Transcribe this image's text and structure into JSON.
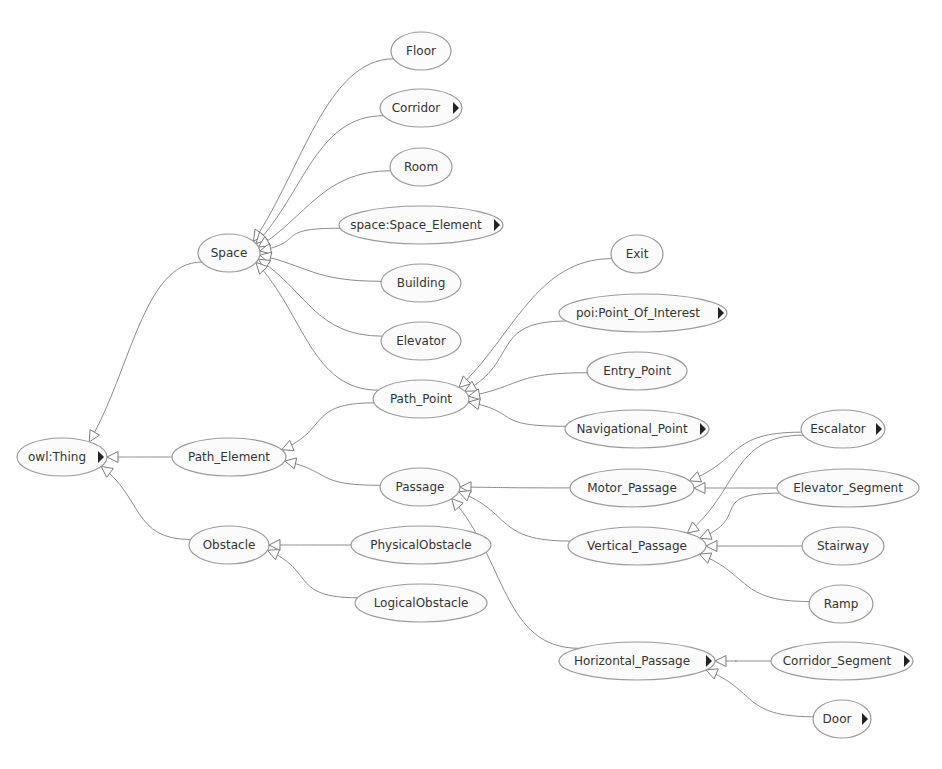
{
  "diagram": {
    "type": "ontology-class-hierarchy",
    "colors": {
      "node_fill": "#fbfbfb",
      "node_stroke": "#9a9a9a",
      "edge": "#8a8a8a",
      "text": "#333333",
      "expand_marker": "#222222"
    },
    "nodes": [
      {
        "id": "owl_thing",
        "label": "owl:Thing",
        "x": 62,
        "y": 457,
        "rx": 45,
        "ry": 19,
        "expandable": true
      },
      {
        "id": "space",
        "label": "Space",
        "x": 229,
        "y": 253,
        "rx": 31,
        "ry": 19,
        "expandable": false
      },
      {
        "id": "path_element",
        "label": "Path_Element",
        "x": 229,
        "y": 457,
        "rx": 57,
        "ry": 19,
        "expandable": false
      },
      {
        "id": "obstacle",
        "label": "Obstacle",
        "x": 229,
        "y": 545,
        "rx": 40,
        "ry": 19,
        "expandable": false
      },
      {
        "id": "floor",
        "label": "Floor",
        "x": 421,
        "y": 51,
        "rx": 30,
        "ry": 19,
        "expandable": false
      },
      {
        "id": "corridor",
        "label": "Corridor",
        "x": 421,
        "y": 108,
        "rx": 41,
        "ry": 19,
        "expandable": true
      },
      {
        "id": "room",
        "label": "Room",
        "x": 421,
        "y": 167,
        "rx": 31,
        "ry": 19,
        "expandable": false
      },
      {
        "id": "space_element",
        "label": "space:Space_Element",
        "x": 421,
        "y": 225,
        "rx": 82,
        "ry": 19,
        "expandable": true
      },
      {
        "id": "building",
        "label": "Building",
        "x": 421,
        "y": 283,
        "rx": 40,
        "ry": 19,
        "expandable": false
      },
      {
        "id": "elevator",
        "label": "Elevator",
        "x": 421,
        "y": 341,
        "rx": 40,
        "ry": 19,
        "expandable": false
      },
      {
        "id": "path_point",
        "label": "Path_Point",
        "x": 421,
        "y": 399,
        "rx": 48,
        "ry": 19,
        "expandable": false
      },
      {
        "id": "passage",
        "label": "Passage",
        "x": 420,
        "y": 487,
        "rx": 40,
        "ry": 19,
        "expandable": false
      },
      {
        "id": "physical_obstacle",
        "label": "PhysicalObstacle",
        "x": 421,
        "y": 545,
        "rx": 70,
        "ry": 19,
        "expandable": false
      },
      {
        "id": "logical_obstacle",
        "label": "LogicalObstacle",
        "x": 421,
        "y": 603,
        "rx": 66,
        "ry": 19,
        "expandable": false
      },
      {
        "id": "exit",
        "label": "Exit",
        "x": 637,
        "y": 254,
        "rx": 26,
        "ry": 19,
        "expandable": false
      },
      {
        "id": "poi",
        "label": "poi:Point_Of_Interest",
        "x": 643,
        "y": 313,
        "rx": 84,
        "ry": 19,
        "expandable": true
      },
      {
        "id": "entry_point",
        "label": "Entry_Point",
        "x": 637,
        "y": 371,
        "rx": 50,
        "ry": 19,
        "expandable": false
      },
      {
        "id": "navigational_point",
        "label": "Navigational_Point",
        "x": 637,
        "y": 429,
        "rx": 72,
        "ry": 19,
        "expandable": true
      },
      {
        "id": "motor_passage",
        "label": "Motor_Passage",
        "x": 632,
        "y": 488,
        "rx": 62,
        "ry": 19,
        "expandable": false
      },
      {
        "id": "vertical_passage",
        "label": "Vertical_Passage",
        "x": 637,
        "y": 546,
        "rx": 69,
        "ry": 19,
        "expandable": false
      },
      {
        "id": "horizontal_passage",
        "label": "Horizontal_Passage",
        "x": 637,
        "y": 661,
        "rx": 78,
        "ry": 19,
        "expandable": true
      },
      {
        "id": "escalator",
        "label": "Escalator",
        "x": 843,
        "y": 429,
        "rx": 42,
        "ry": 19,
        "expandable": true
      },
      {
        "id": "elevator_segment",
        "label": "Elevator_Segment",
        "x": 848,
        "y": 488,
        "rx": 71,
        "ry": 19,
        "expandable": false
      },
      {
        "id": "stairway",
        "label": "Stairway",
        "x": 843,
        "y": 546,
        "rx": 41,
        "ry": 19,
        "expandable": false
      },
      {
        "id": "ramp",
        "label": "Ramp",
        "x": 841,
        "y": 604,
        "rx": 32,
        "ry": 19,
        "expandable": false
      },
      {
        "id": "corridor_segment",
        "label": "Corridor_Segment",
        "x": 842,
        "y": 661,
        "rx": 71,
        "ry": 19,
        "expandable": true
      },
      {
        "id": "door",
        "label": "Door",
        "x": 842,
        "y": 719,
        "rx": 29,
        "ry": 19,
        "expandable": true
      }
    ],
    "edges": [
      {
        "from": "space",
        "to": "owl_thing",
        "relation": "subClassOf"
      },
      {
        "from": "path_element",
        "to": "owl_thing",
        "relation": "subClassOf"
      },
      {
        "from": "obstacle",
        "to": "owl_thing",
        "relation": "subClassOf"
      },
      {
        "from": "floor",
        "to": "space",
        "relation": "subClassOf"
      },
      {
        "from": "corridor",
        "to": "space",
        "relation": "subClassOf"
      },
      {
        "from": "room",
        "to": "space",
        "relation": "subClassOf"
      },
      {
        "from": "space_element",
        "to": "space",
        "relation": "subClassOf"
      },
      {
        "from": "building",
        "to": "space",
        "relation": "subClassOf"
      },
      {
        "from": "elevator",
        "to": "space",
        "relation": "subClassOf"
      },
      {
        "from": "path_point",
        "to": "space",
        "relation": "subClassOf"
      },
      {
        "from": "path_point",
        "to": "path_element",
        "relation": "subClassOf"
      },
      {
        "from": "passage",
        "to": "path_element",
        "relation": "subClassOf"
      },
      {
        "from": "physical_obstacle",
        "to": "obstacle",
        "relation": "subClassOf"
      },
      {
        "from": "logical_obstacle",
        "to": "obstacle",
        "relation": "subClassOf"
      },
      {
        "from": "exit",
        "to": "path_point",
        "relation": "subClassOf"
      },
      {
        "from": "poi",
        "to": "path_point",
        "relation": "subClassOf"
      },
      {
        "from": "entry_point",
        "to": "path_point",
        "relation": "subClassOf"
      },
      {
        "from": "navigational_point",
        "to": "path_point",
        "relation": "subClassOf"
      },
      {
        "from": "motor_passage",
        "to": "passage",
        "relation": "subClassOf"
      },
      {
        "from": "vertical_passage",
        "to": "passage",
        "relation": "subClassOf"
      },
      {
        "from": "horizontal_passage",
        "to": "passage",
        "relation": "subClassOf"
      },
      {
        "from": "escalator",
        "to": "motor_passage",
        "relation": "subClassOf"
      },
      {
        "from": "elevator_segment",
        "to": "motor_passage",
        "relation": "subClassOf"
      },
      {
        "from": "escalator",
        "to": "vertical_passage",
        "relation": "subClassOf"
      },
      {
        "from": "elevator_segment",
        "to": "vertical_passage",
        "relation": "subClassOf"
      },
      {
        "from": "stairway",
        "to": "vertical_passage",
        "relation": "subClassOf"
      },
      {
        "from": "ramp",
        "to": "vertical_passage",
        "relation": "subClassOf"
      },
      {
        "from": "corridor_segment",
        "to": "horizontal_passage",
        "relation": "subClassOf"
      },
      {
        "from": "door",
        "to": "horizontal_passage",
        "relation": "subClassOf"
      }
    ]
  }
}
